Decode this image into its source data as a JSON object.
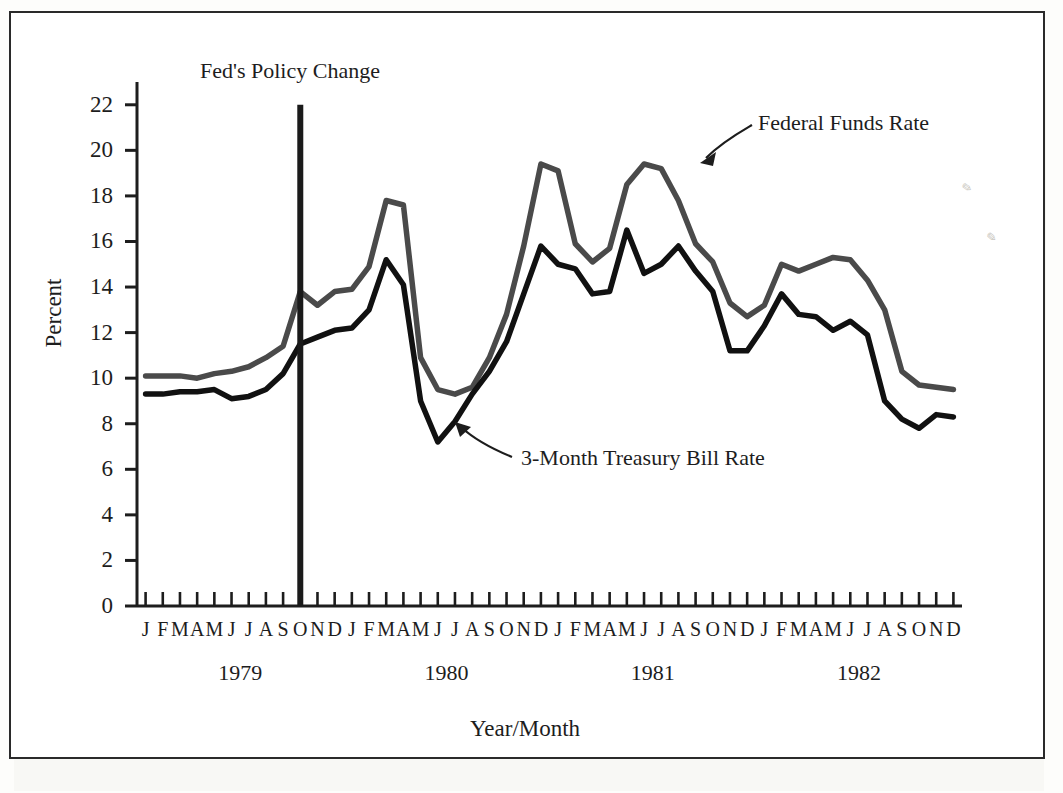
{
  "figure": {
    "y_axis_title": "Percent",
    "x_axis_title": "Year/Month",
    "policy_annotation": "Fed's Policy Change",
    "series_label_federal_funds": "Federal Funds Rate",
    "series_label_treasury_bill": "3-Month Treasury Bill Rate",
    "ytick_labels": [
      "0",
      "2",
      "4",
      "6",
      "8",
      "10",
      "12",
      "14",
      "16",
      "18",
      "20",
      "22"
    ],
    "month_letters": [
      "J",
      "F",
      "M",
      "A",
      "M",
      "J",
      "J",
      "A",
      "S",
      "O",
      "N",
      "D"
    ],
    "year_labels": [
      "1979",
      "1980",
      "1981",
      "1982"
    ],
    "colors": {
      "federal_funds": "#4a4a4a",
      "treasury_bill": "#111111",
      "axis": "#1d1d1d",
      "policy_line": "#1a1a1a",
      "frame": "#2a2a2a",
      "page": "#ffffff"
    }
  },
  "chart_data": {
    "type": "line",
    "title": "",
    "xlabel": "Year/Month",
    "ylabel": "Percent",
    "ylim": [
      0,
      23
    ],
    "ytick_values": [
      0,
      2,
      4,
      6,
      8,
      10,
      12,
      14,
      16,
      18,
      20,
      22
    ],
    "grid": false,
    "legend_position": "inline-annotations",
    "x": [
      "1979-J",
      "1979-F",
      "1979-M",
      "1979-A",
      "1979-M",
      "1979-J",
      "1979-J",
      "1979-A",
      "1979-S",
      "1979-O",
      "1979-N",
      "1979-D",
      "1980-J",
      "1980-F",
      "1980-M",
      "1980-A",
      "1980-M",
      "1980-J",
      "1980-J",
      "1980-A",
      "1980-S",
      "1980-O",
      "1980-N",
      "1980-D",
      "1981-J",
      "1981-F",
      "1981-M",
      "1981-A",
      "1981-M",
      "1981-J",
      "1981-J",
      "1981-A",
      "1981-S",
      "1981-O",
      "1981-N",
      "1981-D",
      "1982-J",
      "1982-F",
      "1982-M",
      "1982-A",
      "1982-M",
      "1982-J",
      "1982-J",
      "1982-A",
      "1982-S",
      "1982-O",
      "1982-N",
      "1982-D"
    ],
    "series": [
      {
        "name": "Federal Funds Rate",
        "color": "#4a4a4a",
        "values": [
          10.1,
          10.1,
          10.1,
          10.0,
          10.2,
          10.3,
          10.5,
          10.9,
          11.4,
          13.8,
          13.2,
          13.8,
          13.9,
          14.9,
          17.8,
          17.6,
          10.9,
          9.5,
          9.3,
          9.6,
          10.9,
          12.8,
          15.8,
          19.4,
          19.1,
          15.9,
          15.1,
          15.7,
          18.5,
          19.4,
          19.2,
          17.8,
          15.9,
          15.1,
          13.3,
          12.7,
          13.2,
          15.0,
          14.7,
          15.0,
          15.3,
          15.2,
          14.3,
          13.0,
          10.3,
          9.7,
          9.6,
          9.5
        ]
      },
      {
        "name": "3-Month Treasury Bill Rate",
        "color": "#111111",
        "values": [
          9.3,
          9.3,
          9.4,
          9.4,
          9.5,
          9.1,
          9.2,
          9.5,
          10.2,
          11.5,
          11.8,
          12.1,
          12.2,
          13.0,
          15.2,
          14.1,
          9.0,
          7.2,
          8.1,
          9.3,
          10.3,
          11.6,
          13.7,
          15.8,
          15.0,
          14.8,
          13.7,
          13.8,
          16.5,
          14.6,
          15.0,
          15.8,
          14.7,
          13.8,
          11.2,
          11.2,
          12.3,
          13.7,
          12.8,
          12.7,
          12.1,
          12.5,
          11.9,
          9.0,
          8.2,
          7.8,
          8.4,
          8.3
        ]
      }
    ],
    "annotations": [
      {
        "text": "Fed's Policy Change",
        "type": "vertical-line",
        "at_x": "1979-O",
        "y_top": 22.0
      },
      {
        "text": "Federal Funds Rate",
        "type": "arrow-callout",
        "points_to_series": "Federal Funds Rate",
        "points_to_x": "1981-J"
      },
      {
        "text": "3-Month Treasury Bill Rate",
        "type": "arrow-callout",
        "points_to_series": "3-Month Treasury Bill Rate",
        "points_to_x": "1980-J"
      }
    ]
  }
}
